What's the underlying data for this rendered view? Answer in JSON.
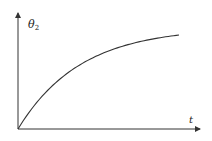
{
  "chart_data": {
    "type": "line",
    "title": "",
    "xlabel": "t",
    "ylabel": "θ₂",
    "ylabel_main": "θ",
    "ylabel_sub": "2",
    "grid": false,
    "legend": null,
    "x_ticks": [],
    "y_ticks": [],
    "series": [
      {
        "name": "θ₂(t)",
        "description": "monotonically increasing, concave, saturating curve starting at origin",
        "x": [
          0,
          0.1,
          0.2,
          0.3,
          0.4,
          0.5,
          0.6,
          0.7,
          0.8,
          0.9,
          1.0
        ],
        "y": [
          0,
          0.3,
          0.5,
          0.63,
          0.72,
          0.79,
          0.85,
          0.89,
          0.93,
          0.96,
          0.98
        ]
      }
    ],
    "xlim": [
      0,
      1.15
    ],
    "ylim": [
      0,
      1.27
    ]
  },
  "colors": {
    "axis": "#333333",
    "curve": "#333333",
    "background": "#ffffff"
  }
}
